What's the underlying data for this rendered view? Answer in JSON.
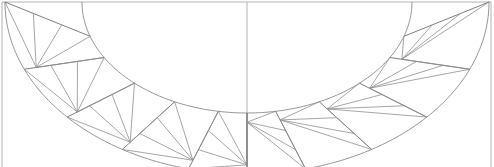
{
  "diagram": {
    "halves": [
      "left",
      "right"
    ],
    "sections_per_half": 5,
    "colors": {
      "background": "#ffffff",
      "frame": "#b4b4b4",
      "arc": "#8a8a8a",
      "seam": "#6f6f6f",
      "spoke": "#8f8f8f"
    }
  }
}
